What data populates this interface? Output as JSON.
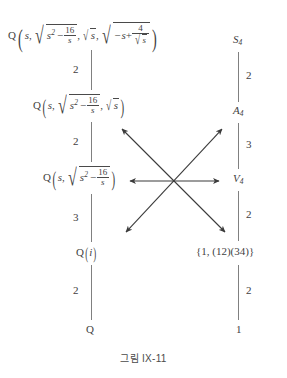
{
  "caption": "그림 IX-11",
  "colors": {
    "text": "#3f3f3f",
    "edge": "#808080",
    "arrow": "#3a3a3a",
    "background": "#ffffff"
  },
  "left_lattice": {
    "name": "field-extension-lattice",
    "nodes": [
      {
        "id": "field-full",
        "plain": "Q(s, sqrt(s^2-16/s), sqrt(s), sqrt(-s+4/sqrt(s)))",
        "base": "Q",
        "args": [
          "s",
          "sqrt(s^2 - 16/s)",
          "sqrt(s)",
          "sqrt(-s + 4/sqrt(s))"
        ]
      },
      {
        "id": "field-three",
        "plain": "Q(s, sqrt(s^2-16/s), sqrt(s))",
        "base": "Q",
        "args": [
          "s",
          "sqrt(s^2 - 16/s)",
          "sqrt(s)"
        ]
      },
      {
        "id": "field-two",
        "plain": "Q(s, sqrt(s^2-16/s))",
        "base": "Q",
        "args": [
          "s",
          "sqrt(s^2 - 16/s)"
        ]
      },
      {
        "id": "field-qi",
        "plain": "Q(i)",
        "base": "Q",
        "args": [
          "i"
        ]
      },
      {
        "id": "field-q",
        "plain": "Q",
        "base": "Q",
        "args": []
      }
    ],
    "edge_labels": [
      "2",
      "2",
      "3",
      "2"
    ],
    "radicand_parts": {
      "s_squared": "s",
      "exponent": "2",
      "minus": "−",
      "frac_16_s_num": "16",
      "frac_16_s_den": "s",
      "neg_s": "−s+",
      "frac_4_sqrt_s_num": "4",
      "frac_4_sqrt_s_den": "s",
      "var_s": "s",
      "var_i": "i",
      "comma": ",",
      "base_q": "Q"
    }
  },
  "right_lattice": {
    "name": "galois-group-lattice",
    "nodes": [
      {
        "id": "group-s4",
        "letter": "S",
        "subscript": "4",
        "plain": "S4"
      },
      {
        "id": "group-a4",
        "letter": "A",
        "subscript": "4",
        "plain": "A4"
      },
      {
        "id": "group-v4",
        "letter": "V",
        "subscript": "4",
        "plain": "V4"
      },
      {
        "id": "group-klein-sub",
        "letter": "",
        "subscript": "",
        "plain": "{1, (12)(34)}"
      },
      {
        "id": "group-trivial",
        "letter": "",
        "subscript": "",
        "plain": "1"
      }
    ],
    "klein_sub_text": "{1, (12)(34)}",
    "trivial_text": "1",
    "edge_labels": [
      "2",
      "3",
      "2",
      "2"
    ]
  },
  "correspondence_arrows": [
    {
      "id": "arrow-horizontal",
      "from_label": "Q(s, sqrt(s^2-16/s))",
      "to_label": "V4",
      "x1": 130,
      "y1": 181,
      "x2": 219,
      "y2": 181,
      "double_headed": true
    },
    {
      "id": "arrow-up-right",
      "from_label": "Q(i)",
      "to_label": "A4",
      "x1": 126,
      "y1": 232,
      "x2": 222,
      "y2": 129,
      "double_headed": true
    },
    {
      "id": "arrow-up-left",
      "from_label": "Q(s, sqrt(s^2-16/s), sqrt(s))",
      "to_label": "{1, (12)(34)}",
      "x1": 122,
      "y1": 129,
      "x2": 225,
      "y2": 232,
      "double_headed": true
    }
  ]
}
